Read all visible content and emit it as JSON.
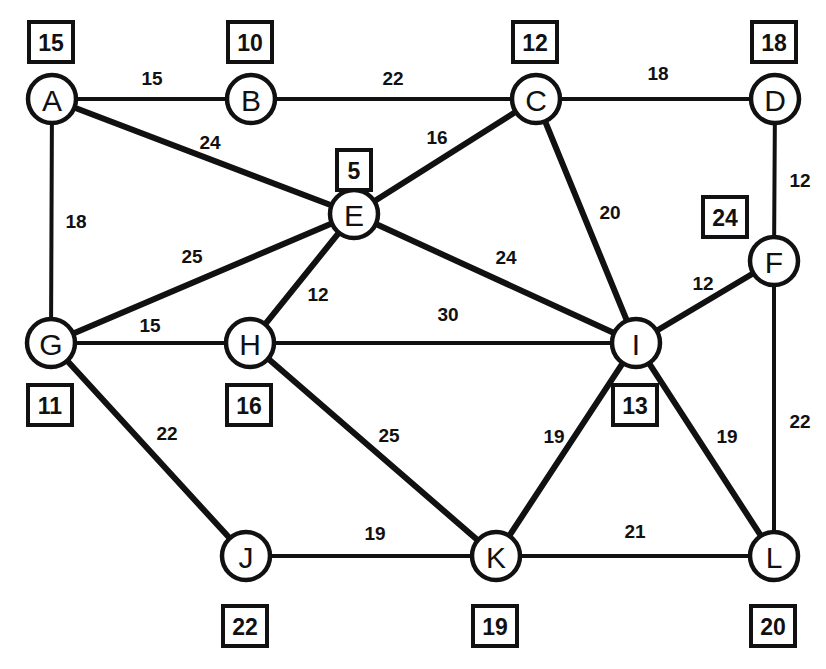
{
  "figure": {
    "type": "weighted-undirected-graph",
    "caption": "",
    "node_radius": 24,
    "colors": {
      "ink": "#111111",
      "paper": "#ffffff"
    }
  },
  "chart_data": {
    "type": "diagram",
    "title": "",
    "xlabel": "",
    "ylabel": "",
    "nodes": [
      {
        "id": "A",
        "label": "A",
        "value": "15",
        "x": 52,
        "y": 99,
        "box_x": 29,
        "box_y": 22,
        "box_w": 44,
        "box_h": 40
      },
      {
        "id": "B",
        "label": "B",
        "value": "10",
        "x": 251,
        "y": 99,
        "box_x": 228,
        "box_y": 22,
        "box_w": 44,
        "box_h": 40
      },
      {
        "id": "C",
        "label": "C",
        "value": "12",
        "x": 536,
        "y": 99,
        "box_x": 513,
        "box_y": 22,
        "box_w": 44,
        "box_h": 40
      },
      {
        "id": "D",
        "label": "D",
        "value": "18",
        "x": 775,
        "y": 99,
        "box_x": 752,
        "box_y": 22,
        "box_w": 44,
        "box_h": 40
      },
      {
        "id": "E",
        "label": "E",
        "value": "5",
        "x": 354,
        "y": 214,
        "box_x": 337,
        "box_y": 150,
        "box_w": 34,
        "box_h": 40
      },
      {
        "id": "F",
        "label": "F",
        "value": "24",
        "x": 774,
        "y": 261,
        "box_x": 703,
        "box_y": 197,
        "box_w": 44,
        "box_h": 40
      },
      {
        "id": "G",
        "label": "G",
        "value": "11",
        "x": 51,
        "y": 343,
        "box_x": 28,
        "box_y": 385,
        "box_w": 44,
        "box_h": 40
      },
      {
        "id": "H",
        "label": "H",
        "value": "16",
        "x": 250,
        "y": 343,
        "box_x": 227,
        "box_y": 385,
        "box_w": 44,
        "box_h": 40
      },
      {
        "id": "I",
        "label": "I",
        "value": "13",
        "x": 636,
        "y": 343,
        "box_x": 613,
        "box_y": 385,
        "box_w": 44,
        "box_h": 40
      },
      {
        "id": "J",
        "label": "J",
        "value": "22",
        "x": 246,
        "y": 556,
        "box_x": 223,
        "box_y": 606,
        "box_w": 44,
        "box_h": 40
      },
      {
        "id": "K",
        "label": "K",
        "value": "19",
        "x": 496,
        "y": 556,
        "box_x": 473,
        "box_y": 606,
        "box_w": 44,
        "box_h": 40
      },
      {
        "id": "L",
        "label": "L",
        "value": "20",
        "x": 774,
        "y": 556,
        "box_x": 751,
        "box_y": 606,
        "box_w": 44,
        "box_h": 40
      }
    ],
    "edges": [
      {
        "from": "A",
        "to": "B",
        "weight": "15",
        "label_x": 152,
        "label_y": 78,
        "thick": false
      },
      {
        "from": "B",
        "to": "C",
        "weight": "22",
        "label_x": 393,
        "label_y": 78,
        "thick": false
      },
      {
        "from": "C",
        "to": "D",
        "weight": "18",
        "label_x": 658,
        "label_y": 73,
        "thick": false
      },
      {
        "from": "A",
        "to": "E",
        "weight": "24",
        "label_x": 210,
        "label_y": 142,
        "thick": true
      },
      {
        "from": "A",
        "to": "G",
        "weight": "18",
        "label_x": 76,
        "label_y": 221,
        "thick": false
      },
      {
        "from": "C",
        "to": "E",
        "weight": "16",
        "label_x": 437,
        "label_y": 137,
        "thick": true
      },
      {
        "from": "C",
        "to": "I",
        "weight": "20",
        "label_x": 610,
        "label_y": 212,
        "thick": true
      },
      {
        "from": "D",
        "to": "F",
        "weight": "12",
        "label_x": 800,
        "label_y": 180,
        "thick": false
      },
      {
        "from": "E",
        "to": "G",
        "weight": "25",
        "label_x": 192,
        "label_y": 256,
        "thick": true
      },
      {
        "from": "E",
        "to": "H",
        "weight": "12",
        "label_x": 318,
        "label_y": 294,
        "thick": true
      },
      {
        "from": "E",
        "to": "I",
        "weight": "24",
        "label_x": 506,
        "label_y": 257,
        "thick": true
      },
      {
        "from": "F",
        "to": "I",
        "weight": "12",
        "label_x": 703,
        "label_y": 283,
        "thick": true
      },
      {
        "from": "F",
        "to": "L",
        "weight": "22",
        "label_x": 800,
        "label_y": 421,
        "thick": false
      },
      {
        "from": "G",
        "to": "H",
        "weight": "15",
        "label_x": 150,
        "label_y": 325,
        "thick": false
      },
      {
        "from": "G",
        "to": "J",
        "weight": "22",
        "label_x": 167,
        "label_y": 433,
        "thick": true
      },
      {
        "from": "H",
        "to": "I",
        "weight": "30",
        "label_x": 448,
        "label_y": 314,
        "thick": false
      },
      {
        "from": "H",
        "to": "K",
        "weight": "25",
        "label_x": 389,
        "label_y": 435,
        "thick": true
      },
      {
        "from": "I",
        "to": "K",
        "weight": "19",
        "label_x": 554,
        "label_y": 436,
        "thick": true
      },
      {
        "from": "I",
        "to": "L",
        "weight": "19",
        "label_x": 727,
        "label_y": 436,
        "thick": true
      },
      {
        "from": "J",
        "to": "K",
        "weight": "19",
        "label_x": 375,
        "label_y": 533,
        "thick": false
      },
      {
        "from": "K",
        "to": "L",
        "weight": "21",
        "label_x": 635,
        "label_y": 531,
        "thick": false
      }
    ]
  }
}
